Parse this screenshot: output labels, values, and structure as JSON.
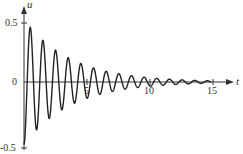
{
  "chart_data": {
    "type": "line",
    "title": "",
    "xlabel": "t",
    "ylabel": "u",
    "xlim": [
      0,
      16
    ],
    "ylim": [
      -0.5,
      0.5
    ],
    "grid": false,
    "legend": null,
    "x_ticks": [
      5,
      10,
      15
    ],
    "x_tick_labels": [
      "5",
      "10",
      "15"
    ],
    "y_ticks": [
      -0.5,
      0,
      0.5
    ],
    "y_tick_labels": [
      "-0.5",
      "0",
      "0.5"
    ],
    "model": {
      "amplitude": -0.5,
      "decay_rate": 0.27,
      "period": 1.0,
      "t_start": 0,
      "t_end": 14.8
    },
    "series": [
      {
        "name": "u(t)",
        "color": "#222222",
        "x": [
          0,
          0.5,
          1,
          1.5,
          2,
          2.5,
          3,
          3.5,
          4,
          4.5,
          5,
          5.5,
          6,
          6.5,
          7,
          7.5,
          8,
          8.5,
          9,
          9.5,
          10,
          10.5,
          11,
          11.5,
          12,
          12.5,
          13,
          13.5,
          14,
          14.5
        ],
        "values": [
          -0.5,
          0.44,
          -0.38,
          0.33,
          -0.29,
          0.25,
          -0.22,
          0.19,
          -0.17,
          0.15,
          -0.13,
          0.11,
          -0.1,
          0.09,
          -0.08,
          0.07,
          -0.06,
          0.05,
          -0.04,
          0.04,
          -0.03,
          0.03,
          -0.03,
          0.02,
          -0.02,
          0.02,
          -0.01,
          0.01,
          -0.01,
          0.01
        ]
      }
    ]
  },
  "axes": {
    "x_label": "t",
    "y_label": "u",
    "tick_labels": {
      "y_pos": "0.5",
      "y_zero": "0",
      "y_neg": "-0.5",
      "x_5": "5",
      "x_10": "10",
      "x_15": "15"
    }
  }
}
